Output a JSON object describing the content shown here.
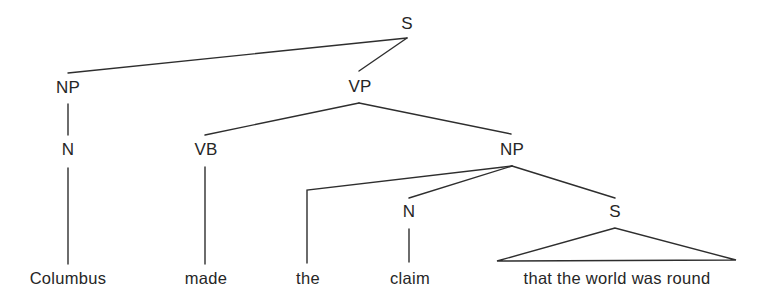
{
  "diagram": {
    "type": "syntax-tree",
    "nodes": {
      "s_root": "S",
      "np_subject": "NP",
      "vp": "VP",
      "n_subject": "N",
      "vb": "VB",
      "np_object": "NP",
      "n_object": "N",
      "s_embedded": "S"
    },
    "words": {
      "columbus": "Columbus",
      "made": "made",
      "the": "the",
      "claim": "claim",
      "clause": "that the world was round"
    },
    "edges": [
      [
        "S",
        "NP"
      ],
      [
        "S",
        "VP"
      ],
      [
        "NP",
        "N"
      ],
      [
        "N",
        "Columbus"
      ],
      [
        "VP",
        "VB"
      ],
      [
        "VP",
        "NP"
      ],
      [
        "VB",
        "made"
      ],
      [
        "NP",
        "the"
      ],
      [
        "NP",
        "N"
      ],
      [
        "NP",
        "S"
      ],
      [
        "N",
        "claim"
      ],
      [
        "S",
        "that the world was round (triangle)"
      ]
    ],
    "colors": {
      "line": "#2e2e2e",
      "text": "#262626",
      "background": "#ffffff"
    }
  }
}
